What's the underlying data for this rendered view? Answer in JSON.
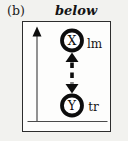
{
  "figure": {
    "panel_label": "(b)",
    "title": "below",
    "node_x": {
      "label": "X",
      "tag": "lm"
    },
    "node_y": {
      "label": "Y",
      "tag": "tr"
    },
    "edge": {
      "style": "dashed",
      "direction": "bidirectional"
    },
    "colors": {
      "ink": "#0d0d0d",
      "axis": "#4a4a4a",
      "frame": "#2d2d2d",
      "node_fill": "#ffffff",
      "background": "#f2f2ef"
    }
  }
}
